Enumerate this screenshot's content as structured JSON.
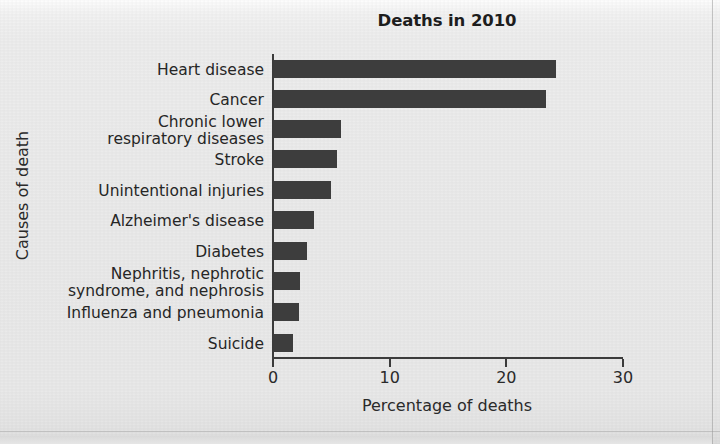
{
  "figure": {
    "background_color": "#eaeaea",
    "bar_color": "#3d3d3d",
    "axis_color": "#3b3b3b",
    "text_color": "#262626"
  },
  "chart_data": {
    "type": "bar",
    "orientation": "horizontal",
    "title": "Deaths in 2010",
    "xlabel": "Percentage of deaths",
    "ylabel": "Causes of death",
    "categories": [
      "Heart disease",
      "Cancer",
      "Chronic lower\nrespiratory diseases",
      "Stroke",
      "Unintentional injuries",
      "Alzheimer's disease",
      "Diabetes",
      "Nephritis, nephrotic\nsyndrome, and nephrosis",
      "Influenza and pneumonia",
      "Suicide"
    ],
    "values": [
      24.2,
      23.3,
      5.7,
      5.4,
      4.9,
      3.4,
      2.8,
      2.2,
      2.1,
      1.6
    ],
    "xlim": [
      0,
      30
    ],
    "xticks": [
      0,
      10,
      20,
      30
    ],
    "xticklabels": [
      "0",
      "10",
      "20",
      "30"
    ],
    "grid": false,
    "legend": null
  },
  "labels": {
    "c0": "Heart disease",
    "c1": "Cancer",
    "c2_line1": "Chronic lower",
    "c2_line2": "respiratory diseases",
    "c3": "Stroke",
    "c4": "Unintentional injuries",
    "c5": "Alzheimer's disease",
    "c6": "Diabetes",
    "c7_line1": "Nephritis, nephrotic",
    "c7_line2": "syndrome, and nephrosis",
    "c8": "Influenza and pneumonia",
    "c9": "Suicide"
  }
}
